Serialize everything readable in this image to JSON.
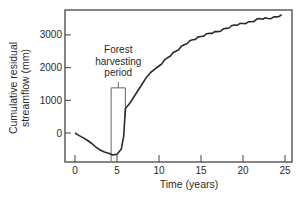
{
  "chart_data": {
    "type": "line",
    "title": "",
    "xlabel": "Time (years)",
    "ylabel_line1": "Cumulative residual",
    "ylabel_line2": "streamflow (mm)",
    "ylabel": "Cumulative residual streamflow (mm)",
    "xlim": [
      -1.2,
      25.8
    ],
    "ylim": [
      -900,
      3800
    ],
    "xticks": [
      0,
      5,
      10,
      15,
      20,
      25
    ],
    "xtick_labels": [
      "0",
      "5",
      "10",
      "15",
      "20",
      "25"
    ],
    "yticks": [
      0,
      1000,
      2000,
      3000
    ],
    "ytick_labels": [
      "0",
      "1000",
      "2000",
      "3000"
    ],
    "grid": false,
    "legend": null,
    "series": [
      {
        "name": "Cumulative residual streamflow",
        "x": [
          0,
          0.5,
          1,
          1.5,
          2,
          2.5,
          3,
          3.5,
          4,
          4.5,
          5,
          5.5,
          5.8,
          6,
          6.5,
          7,
          7.5,
          8,
          8.5,
          9,
          9.5,
          10,
          11,
          12,
          13,
          14,
          15,
          16,
          17,
          18,
          19,
          20,
          21,
          22,
          23,
          24,
          24.6
        ],
        "values": [
          0,
          -80,
          -150,
          -230,
          -320,
          -430,
          -520,
          -580,
          -620,
          -670,
          -650,
          -500,
          -100,
          750,
          900,
          1100,
          1300,
          1500,
          1700,
          1850,
          1950,
          2050,
          2300,
          2500,
          2700,
          2850,
          2950,
          3050,
          3100,
          3200,
          3300,
          3350,
          3400,
          3500,
          3500,
          3550,
          3620
        ]
      }
    ],
    "annotations": [
      {
        "text_lines": [
          "Forest",
          "harvesting",
          "period"
        ],
        "type": "bracket-box",
        "x_start": 4.3,
        "x_end": 6.0,
        "y_top": 1380
      }
    ]
  }
}
